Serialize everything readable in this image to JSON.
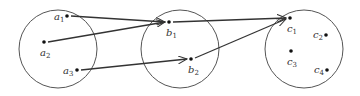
{
  "diagram": {
    "type": "function-mapping",
    "sets": [
      {
        "name": "A",
        "cx": 58,
        "cy": 49,
        "r": 39,
        "points": [
          {
            "base": "a",
            "sub": "1",
            "x": 67,
            "y": 16,
            "lx": 54,
            "ly": 20
          },
          {
            "base": "a",
            "sub": "2",
            "x": 44,
            "y": 42,
            "lx": 40,
            "ly": 56
          },
          {
            "base": "a",
            "sub": "3",
            "x": 77,
            "y": 70,
            "lx": 63,
            "ly": 74
          }
        ]
      },
      {
        "name": "B",
        "cx": 180,
        "cy": 49,
        "r": 39,
        "points": [
          {
            "base": "b",
            "sub": "1",
            "x": 169,
            "y": 22,
            "lx": 166,
            "ly": 36
          },
          {
            "base": "b",
            "sub": "2",
            "x": 191,
            "y": 59,
            "lx": 188,
            "ly": 73
          }
        ]
      },
      {
        "name": "C",
        "cx": 304,
        "cy": 49,
        "r": 39,
        "points": [
          {
            "base": "c",
            "sub": "1",
            "x": 290,
            "y": 18,
            "lx": 287,
            "ly": 32
          },
          {
            "base": "c",
            "sub": "2",
            "x": 326,
            "y": 35,
            "lx": 313,
            "ly": 38
          },
          {
            "base": "c",
            "sub": "3",
            "x": 291,
            "y": 51,
            "lx": 287,
            "ly": 65
          },
          {
            "base": "c",
            "sub": "4",
            "x": 327,
            "y": 70,
            "lx": 314,
            "ly": 73
          }
        ]
      }
    ],
    "arrows": [
      {
        "from": "a1",
        "to": "b1",
        "x1": 71,
        "y1": 16,
        "x2": 165,
        "y2": 22
      },
      {
        "from": "a2",
        "to": "b1",
        "x1": 48,
        "y1": 42,
        "x2": 165,
        "y2": 22
      },
      {
        "from": "a3",
        "to": "b2",
        "x1": 81,
        "y1": 70,
        "x2": 187,
        "y2": 59
      },
      {
        "from": "b1",
        "to": "c1",
        "x1": 173,
        "y1": 22,
        "x2": 286,
        "y2": 18
      },
      {
        "from": "b2",
        "to": "c1",
        "x1": 195,
        "y1": 58,
        "x2": 286,
        "y2": 19
      }
    ],
    "colors": {
      "stroke": "#333333",
      "circle": "#555555"
    }
  }
}
